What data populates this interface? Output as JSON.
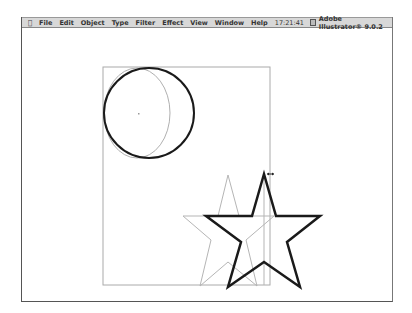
{
  "menubar": {
    "apple_icon": "apple-menu-icon",
    "items": [
      "File",
      "Edit",
      "Object",
      "Type",
      "Filter",
      "Effect",
      "View",
      "Window",
      "Help"
    ],
    "clock": "17:21:41",
    "app_name": "Adobe Illustrator® 9.0.2"
  },
  "canvas": {
    "artboard": {
      "x": 103,
      "y": 67,
      "width": 167,
      "height": 218,
      "stroke": "#aaaaaa"
    },
    "circle_bold": {
      "cx": 149,
      "cy": 113,
      "r": 45,
      "stroke": "#1a1a1a",
      "stroke_width": 2
    },
    "circle_ghost": {
      "stroke": "#b0b0b0"
    },
    "star_bold": {
      "stroke": "#1a1a1a",
      "stroke_width": 2.5
    },
    "star_ghost": {
      "stroke": "#b5b5b5"
    },
    "cursor": "resize-horizontal-cursor"
  }
}
